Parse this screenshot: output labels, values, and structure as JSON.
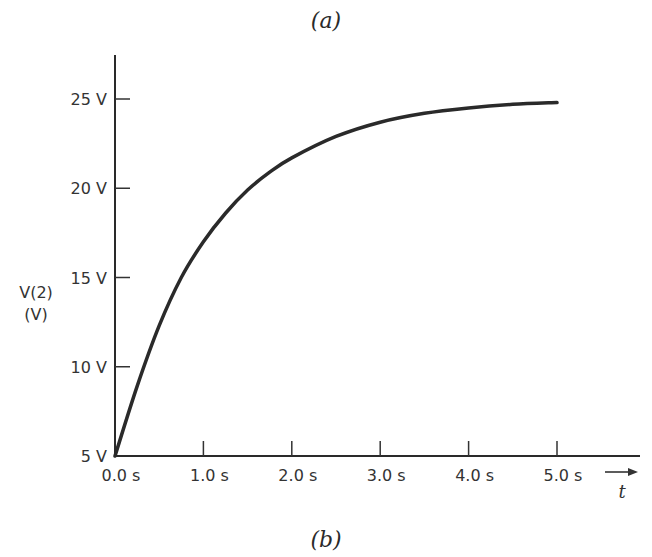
{
  "captions": {
    "top": "(a)",
    "bottom": "(b)"
  },
  "chart_data": {
    "type": "line",
    "title": "",
    "xlabel": "t",
    "ylabel": "V(2)",
    "ylabel_unit": "(V)",
    "xlim": [
      0,
      5.5
    ],
    "ylim": [
      5,
      27.5
    ],
    "xticks": [
      {
        "value": 0,
        "label": "0.0 s"
      },
      {
        "value": 1,
        "label": "1.0 s"
      },
      {
        "value": 2,
        "label": "2.0 s"
      },
      {
        "value": 3,
        "label": "3.0 s"
      },
      {
        "value": 4,
        "label": "4.0 s"
      },
      {
        "value": 5,
        "label": "5.0 s"
      }
    ],
    "yticks": [
      {
        "value": 5,
        "label": "5 V"
      },
      {
        "value": 10,
        "label": "10 V"
      },
      {
        "value": 15,
        "label": "15 V"
      },
      {
        "value": 20,
        "label": "20 V"
      },
      {
        "value": 25,
        "label": "25 V"
      }
    ],
    "grid": false,
    "series": [
      {
        "name": "V(2)",
        "color": "#2a2a2a",
        "x": [
          0,
          0.25,
          0.5,
          0.75,
          1.0,
          1.25,
          1.5,
          1.75,
          2.0,
          2.5,
          3.0,
          3.5,
          4.0,
          4.5,
          5.0
        ],
        "values": [
          5.0,
          8.9,
          12.3,
          15.0,
          17.0,
          18.6,
          19.9,
          20.9,
          21.7,
          22.9,
          23.7,
          24.2,
          24.5,
          24.7,
          24.8
        ]
      }
    ],
    "annotations": [
      {
        "text": "→ t",
        "position": "x-axis end"
      }
    ]
  }
}
